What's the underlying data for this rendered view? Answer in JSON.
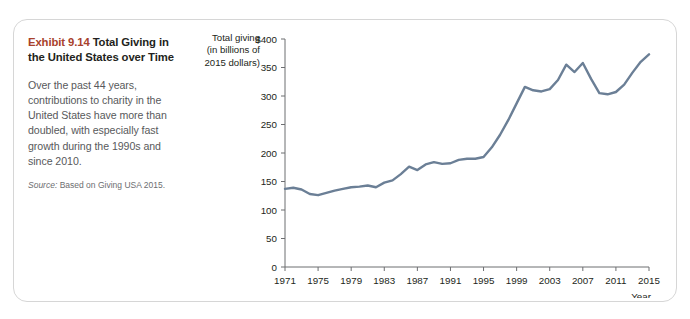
{
  "figure": {
    "exhibit_number": "Exhibit 9.14",
    "exhibit_title": "Total Giving in the United States over Time",
    "body_text": "Over the past 44 years, contributions to charity in the United States have more than doubled, with especially fast growth during the 1990s and since 2010.",
    "source_label": "Source:",
    "source_text": " Based on Giving USA 2015.",
    "accent_color": "#a8412c",
    "line_color": "#6b7f96"
  },
  "chart_data": {
    "type": "line",
    "title": "Total Giving in the United States over Time",
    "ylabel": "Total giving (in billions of 2015 dollars)",
    "xlabel": "Year",
    "ylim": [
      0,
      400
    ],
    "xlim": [
      1971,
      2015
    ],
    "y_unit_prefix": "$",
    "grid": false,
    "legend": "none",
    "y_ticks": [
      0,
      50,
      100,
      150,
      200,
      250,
      300,
      350,
      400
    ],
    "y_tick_labels": [
      "0",
      "50",
      "100",
      "150",
      "200",
      "250",
      "300",
      "350",
      "$400"
    ],
    "x_ticks": [
      1971,
      1975,
      1979,
      1983,
      1987,
      1991,
      1995,
      1999,
      2003,
      2007,
      2011,
      2015
    ],
    "x_tick_labels": [
      "1971",
      "1975",
      "1979",
      "1983",
      "1987",
      "1991",
      "1995",
      "1999",
      "2003",
      "2007",
      "2011",
      "2015"
    ],
    "series": [
      {
        "name": "Total giving",
        "x": [
          1971,
          1972,
          1973,
          1974,
          1975,
          1976,
          1977,
          1978,
          1979,
          1980,
          1981,
          1982,
          1983,
          1984,
          1985,
          1986,
          1987,
          1988,
          1989,
          1990,
          1991,
          1992,
          1993,
          1994,
          1995,
          1996,
          1997,
          1998,
          1999,
          2000,
          2001,
          2002,
          2003,
          2004,
          2005,
          2006,
          2007,
          2008,
          2009,
          2010,
          2011,
          2012,
          2013,
          2014,
          2015
        ],
        "values": [
          137,
          139,
          136,
          128,
          126,
          130,
          134,
          137,
          140,
          141,
          143,
          140,
          148,
          152,
          163,
          176,
          170,
          180,
          184,
          181,
          182,
          188,
          190,
          190,
          193,
          210,
          232,
          258,
          287,
          316,
          310,
          308,
          312,
          328,
          355,
          342,
          358,
          330,
          305,
          303,
          307,
          320,
          341,
          360,
          373
        ]
      }
    ]
  }
}
